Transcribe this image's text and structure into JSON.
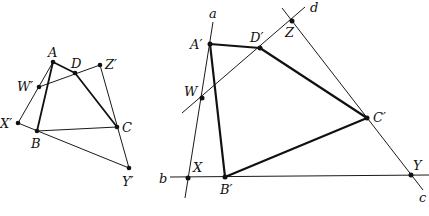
{
  "figure": {
    "left": {
      "points": {
        "A": {
          "label": "A",
          "x": 53,
          "y": 62
        },
        "D": {
          "label": "D",
          "x": 75,
          "y": 73
        },
        "Zp": {
          "label": "Z′",
          "x": 100,
          "y": 65
        },
        "Wp": {
          "label": "W′",
          "x": 39,
          "y": 87
        },
        "Xp": {
          "label": "X′",
          "x": 18,
          "y": 123
        },
        "B": {
          "label": "B",
          "x": 37,
          "y": 131
        },
        "C": {
          "label": "C",
          "x": 117,
          "y": 127
        },
        "Yp": {
          "label": "Y′",
          "x": 129,
          "y": 168
        }
      }
    },
    "right": {
      "points": {
        "Ap": {
          "label": "A′",
          "x": 210,
          "y": 44
        },
        "Dp": {
          "label": "D′",
          "x": 260,
          "y": 48
        },
        "Z": {
          "label": "Z",
          "x": 292,
          "y": 21
        },
        "W": {
          "label": "W",
          "x": 202,
          "y": 98
        },
        "X": {
          "label": "X",
          "x": 188,
          "y": 178
        },
        "Bp": {
          "label": "B′",
          "x": 225,
          "y": 177
        },
        "Cp": {
          "label": "C′",
          "x": 367,
          "y": 118
        },
        "Y": {
          "label": "Y",
          "x": 411,
          "y": 175
        }
      },
      "lines": {
        "a": {
          "label": "a"
        },
        "b": {
          "label": "b"
        },
        "c": {
          "label": "c"
        },
        "d": {
          "label": "d"
        }
      }
    }
  }
}
